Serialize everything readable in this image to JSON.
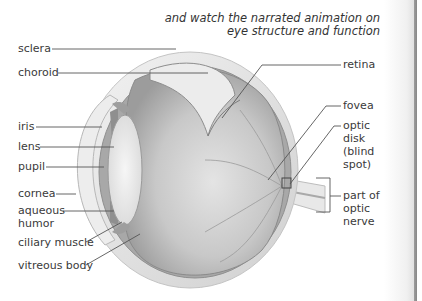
{
  "caption": {
    "cut_line": "Read the Who?",
    "line1": "and watch the narrated animation on",
    "line2": "eye structure and function"
  },
  "labels": {
    "left": [
      {
        "id": "sclera",
        "text": "sclera"
      },
      {
        "id": "choroid",
        "text": "choroid"
      },
      {
        "id": "iris",
        "text": "iris"
      },
      {
        "id": "lens",
        "text": "lens"
      },
      {
        "id": "pupil",
        "text": "pupil"
      },
      {
        "id": "cornea",
        "text": "cornea"
      },
      {
        "id": "aqueous_humor_1",
        "text": "aqueous"
      },
      {
        "id": "aqueous_humor_2",
        "text": "humor"
      },
      {
        "id": "ciliary_muscle",
        "text": "ciliary muscle"
      },
      {
        "id": "vitreous_body",
        "text": "vitreous body"
      }
    ],
    "right": [
      {
        "id": "retina",
        "text": "retina"
      },
      {
        "id": "fovea",
        "text": "fovea"
      },
      {
        "id": "optic_disk_1",
        "text": "optic"
      },
      {
        "id": "optic_disk_2",
        "text": "disk"
      },
      {
        "id": "optic_disk_3",
        "text": "(blind"
      },
      {
        "id": "optic_disk_4",
        "text": "spot)"
      },
      {
        "id": "optic_nerve_1",
        "text": "part of"
      },
      {
        "id": "optic_nerve_2",
        "text": "optic"
      },
      {
        "id": "optic_nerve_3",
        "text": "nerve"
      }
    ]
  },
  "colors": {
    "leader_line": "#555555",
    "sclera": "#e6e6e6",
    "interior": "#b9b9b9",
    "page_edge": "#8a8a8a"
  }
}
